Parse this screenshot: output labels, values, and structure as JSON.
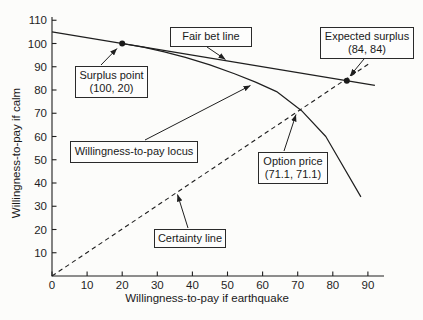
{
  "figure": {
    "background": "#fcfcfa",
    "line_color": "#1f1f1f"
  },
  "chart_data": {
    "type": "line",
    "title": "",
    "xlabel": "Willingness-to-pay if earthquake",
    "ylabel": "Willingness-to-pay if calm",
    "xlim": [
      0,
      95
    ],
    "ylim": [
      0,
      112
    ],
    "x_ticks": [
      0,
      10,
      20,
      30,
      40,
      50,
      60,
      70,
      80,
      90
    ],
    "y_ticks": [
      10,
      20,
      30,
      40,
      50,
      60,
      70,
      80,
      90,
      100,
      110
    ],
    "grid": false,
    "legend": "none",
    "series": [
      {
        "name": "Fair bet line",
        "style": "solid",
        "points": [
          [
            0,
            105
          ],
          [
            92,
            82
          ]
        ]
      },
      {
        "name": "Willingness-to-pay locus",
        "style": "solid",
        "points": [
          [
            20,
            100
          ],
          [
            26,
            98.4
          ],
          [
            32,
            96.4
          ],
          [
            38,
            94
          ],
          [
            45,
            90.8
          ],
          [
            52,
            87
          ],
          [
            58,
            83.4
          ],
          [
            64,
            79.3
          ],
          [
            71.1,
            71.1
          ],
          [
            78,
            60
          ],
          [
            88,
            34
          ]
        ]
      },
      {
        "name": "Certainty line",
        "style": "dashed",
        "points": [
          [
            0,
            0
          ],
          [
            90.5,
            91.5
          ]
        ]
      }
    ],
    "markers": [
      {
        "name": "Surplus point",
        "x": 20,
        "y": 100
      },
      {
        "name": "Expected surplus",
        "x": 84,
        "y": 84
      }
    ]
  },
  "annotations": {
    "fair_bet": {
      "line1": "Fair bet line"
    },
    "expected_surplus": {
      "line1": "Expected surplus",
      "line2": "(84, 84)"
    },
    "surplus_point": {
      "line1": "Surplus point",
      "line2": "(100, 20)"
    },
    "wtp_locus": {
      "line1": "Willingness-to-pay locus"
    },
    "option_price": {
      "line1": "Option price",
      "line2": "(71.1, 71.1)"
    },
    "certainty": {
      "line1": "Certainty line"
    }
  }
}
